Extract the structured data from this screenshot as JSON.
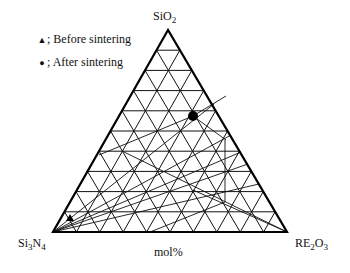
{
  "legend": {
    "items": [
      {
        "symbol": "triangle",
        "glyph": "▲",
        "label": "; Before sintering"
      },
      {
        "symbol": "circle",
        "glyph": "●",
        "label": "; After sintering"
      }
    ]
  },
  "vertices": {
    "top": {
      "base": "SiO",
      "sub": "2"
    },
    "left": {
      "base": "Si",
      "sub1": "3",
      "mid": "N",
      "sub2": "4"
    },
    "right": {
      "base": "RE",
      "sub1": "2",
      "mid": "O",
      "sub2": "3"
    }
  },
  "axis_label": "mol%",
  "grid": {
    "divisions": 10,
    "color": "#111111"
  },
  "triangle": {
    "apex": [
      168,
      30
    ],
    "bottom_left": [
      53,
      232
    ],
    "bottom_right": [
      287,
      232
    ]
  },
  "points": {
    "before_sintering": {
      "xy": [
        70,
        218
      ],
      "marker": "triangle"
    },
    "after_sintering": {
      "xy": [
        193,
        116
      ],
      "marker": "circle"
    }
  },
  "tie_lines": [
    [
      [
        53,
        232
      ],
      [
        259,
        184
      ]
    ],
    [
      [
        53,
        232
      ],
      [
        248,
        164
      ]
    ],
    [
      [
        53,
        232
      ],
      [
        241,
        152
      ]
    ],
    [
      [
        53,
        232
      ],
      [
        231,
        135
      ]
    ],
    [
      [
        53,
        232
      ],
      [
        214,
        104
      ]
    ],
    [
      [
        99,
        155
      ],
      [
        193,
        116
      ]
    ],
    [
      [
        193,
        116
      ],
      [
        226,
        96
      ]
    ],
    [
      [
        193,
        116
      ],
      [
        226,
        140
      ]
    ],
    [
      [
        225,
        140
      ],
      [
        225,
        202
      ]
    ],
    [
      [
        150,
        232
      ],
      [
        225,
        202
      ]
    ],
    [
      [
        193,
        190
      ],
      [
        287,
        232
      ]
    ],
    [
      [
        122,
        151
      ],
      [
        287,
        232
      ]
    ]
  ]
}
